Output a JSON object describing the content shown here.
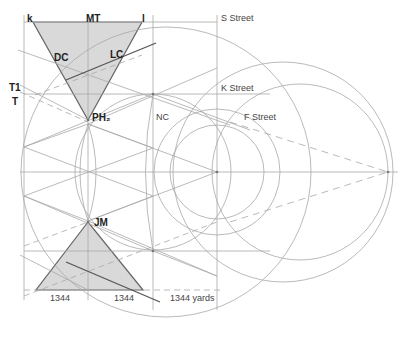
{
  "labels": {
    "k": "k",
    "MT": "MT",
    "l": "l",
    "DC": "DC",
    "LC": "LC",
    "T1": "T1",
    "T": "T",
    "PH2": "PH₂",
    "NC": "NC",
    "JM": "JM",
    "s_street": "S Street",
    "k_street": "K Street",
    "f_street": "F Street",
    "dim_left": "1344",
    "dim_mid": "1344",
    "dim_right": "1344 yards"
  },
  "colors": {
    "triangle_fill": "#d9d9d9",
    "line": "#9a9a9a",
    "dark_line": "#555555",
    "background": "#ffffff"
  }
}
